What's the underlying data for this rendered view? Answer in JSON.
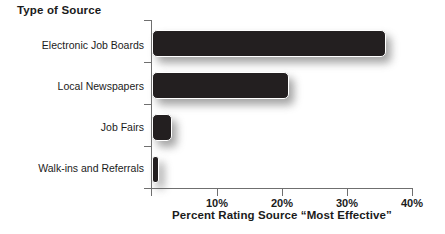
{
  "chart_data": {
    "type": "bar",
    "orientation": "horizontal",
    "title": "Type of Source",
    "xlabel": "Percent Rating Source “Most Effective”",
    "ylabel": "Type of Source",
    "categories": [
      "Electronic Job Boards",
      "Local Newspapers",
      "Job Fairs",
      "Walk-ins and Referrals"
    ],
    "values": [
      36,
      21,
      3,
      1
    ],
    "xlim": [
      0,
      40
    ],
    "xticks": [
      0,
      10,
      20,
      30,
      40
    ],
    "xtick_labels": [
      "",
      "10%",
      "20%",
      "30%",
      "40%"
    ],
    "grid": false,
    "legend": false,
    "bar_color": "#231f20",
    "axis_color": "#6f6f6f",
    "text_color": "#1b1b1b",
    "background": "#ffffff"
  },
  "axis": {
    "tick_labels": [
      {
        "text": "10%",
        "value": 10
      },
      {
        "text": "20%",
        "value": 20
      },
      {
        "text": "30%",
        "value": 30
      },
      {
        "text": "40%",
        "value": 40
      }
    ]
  },
  "series": [
    {
      "label": "Electronic Job Boards",
      "value": 36
    },
    {
      "label": "Local Newspapers",
      "value": 21
    },
    {
      "label": "Job Fairs",
      "value": 3
    },
    {
      "label": "Walk-ins and Referrals",
      "value": 1
    }
  ]
}
